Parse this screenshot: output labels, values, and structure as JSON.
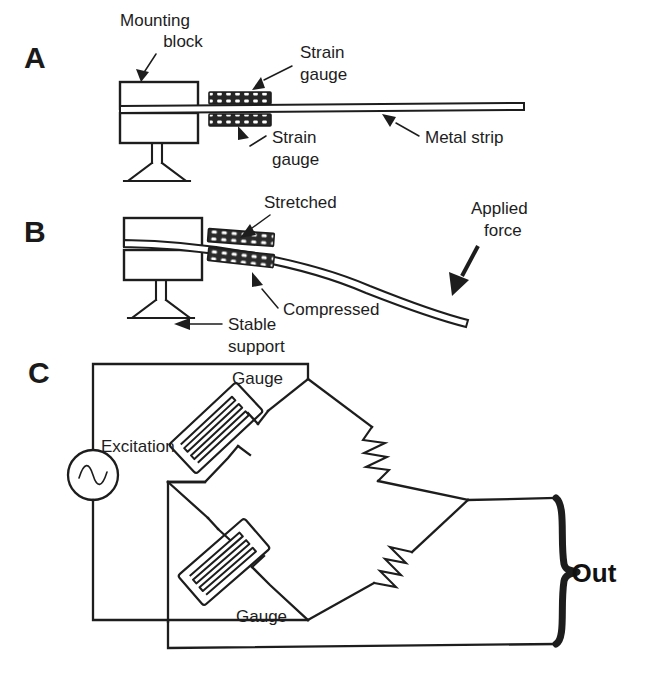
{
  "figure": {
    "background_color": "#ffffff",
    "line_color": "#1d1d1d",
    "width": 652,
    "height": 673
  },
  "panels": {
    "a": {
      "letter": "A",
      "labels": {
        "mounting_block_line1": "Mounting",
        "mounting_block_line2": "block",
        "strain_gauge_top_line1": "Strain",
        "strain_gauge_top_line2": "gauge",
        "strain_gauge_bottom_line1": "Strain",
        "strain_gauge_bottom_line2": "gauge",
        "metal_strip": "Metal strip"
      }
    },
    "b": {
      "letter": "B",
      "labels": {
        "stretched": "Stretched",
        "compressed": "Compressed",
        "stable_support_line1": "Stable",
        "stable_support_line2": "support",
        "applied_force_line1": "Applied",
        "applied_force_line2": "force"
      }
    },
    "c": {
      "letter": "C",
      "labels": {
        "excitation": "Excitation",
        "gauge_top": "Gauge",
        "gauge_bottom": "Gauge",
        "out": "Out"
      },
      "components": {
        "source_type": "ac-source",
        "resistor_count": 2,
        "gauge_count": 2
      }
    }
  }
}
